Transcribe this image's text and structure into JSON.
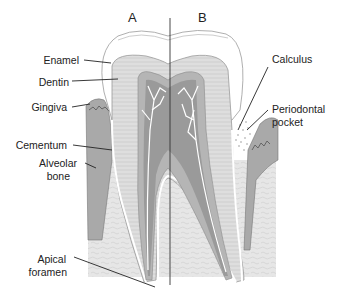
{
  "figure": {
    "sections": {
      "left": "A",
      "right": "B"
    },
    "labels_left": {
      "enamel": "Enamel",
      "dentin": "Dentin",
      "gingiva": "Gingiva",
      "cementum": "Cementum",
      "alveolar_bone_1": "Alveolar",
      "alveolar_bone_2": "bone",
      "apical_foramen_1": "Apical",
      "apical_foramen_2": "foramen"
    },
    "labels_right": {
      "calculus": "Calculus",
      "periodontal_pocket_1": "Periodontal",
      "periodontal_pocket_2": "pocket"
    },
    "colors": {
      "enamel": "#ffffff",
      "dentin": "#dcdcdc",
      "pulp": "#9a9a9a",
      "pulp_outer": "#b8b8b8",
      "bone": "#e4e4e4",
      "gingiva": "#a8a8a8",
      "line": "#222222"
    }
  }
}
